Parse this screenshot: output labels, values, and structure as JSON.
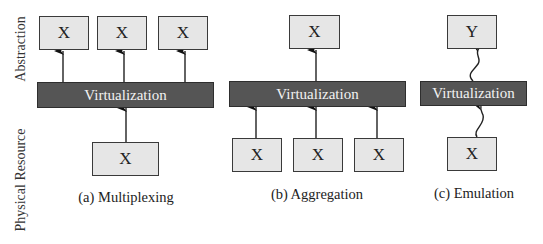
{
  "axis_labels": {
    "top": "Abstraction",
    "bottom": "Physical Resource"
  },
  "panels": [
    {
      "id": "a",
      "caption": "(a) Multiplexing",
      "bar_label": "Virtualization",
      "top_boxes": [
        "X",
        "X",
        "X"
      ],
      "bottom_boxes": [
        "X"
      ],
      "connector": "straight-arrow"
    },
    {
      "id": "b",
      "caption": "(b) Aggregation",
      "bar_label": "Virtualization",
      "top_boxes": [
        "X"
      ],
      "bottom_boxes": [
        "X",
        "X",
        "X"
      ],
      "connector": "straight-arrow"
    },
    {
      "id": "c",
      "caption": "(c) Emulation",
      "bar_label": "Virtualization",
      "top_boxes": [
        "Y"
      ],
      "bottom_boxes": [
        "X"
      ],
      "connector": "wavy-arrow"
    }
  ],
  "colors": {
    "box_fill": "#e6e6e6",
    "bar_fill": "#555555",
    "bar_text": "#f2f2f2",
    "line": "#222222"
  }
}
